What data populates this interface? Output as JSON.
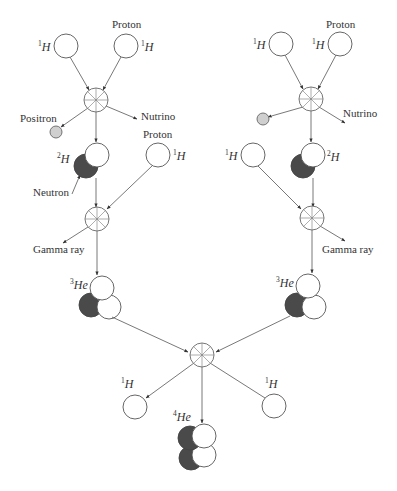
{
  "diagram": {
    "labels": {
      "proton": "Proton",
      "positron": "Positron",
      "neutrino": "Nutrino",
      "neutron": "Neutron",
      "gamma": "Gamma ray",
      "h": "H",
      "he": "He"
    },
    "isotopes": {
      "h1_mass": "1",
      "h2_mass": "2",
      "he3_mass": "3",
      "he4_mass": "4"
    },
    "colors": {
      "proton_fill": "#ffffff",
      "neutron_fill": "#4a4a4a",
      "positron_fill": "#cfcfcf",
      "line": "#555555"
    }
  }
}
